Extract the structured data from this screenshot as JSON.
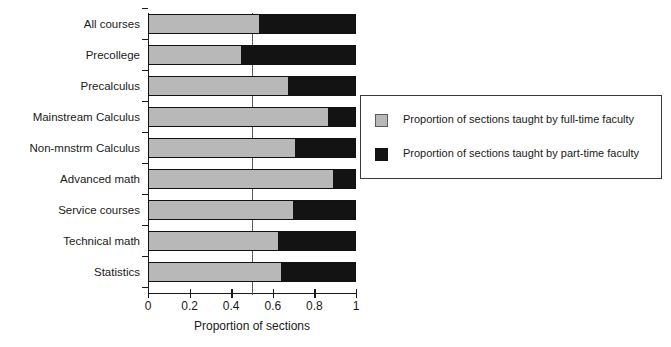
{
  "chart_data": {
    "type": "bar",
    "orientation": "horizontal",
    "stacked": true,
    "normalized": true,
    "title": "",
    "xlabel": "Proportion of sections",
    "ylabel": "",
    "xlim": [
      0,
      1
    ],
    "xticks": [
      0,
      0.2,
      0.4,
      0.6,
      0.8,
      1
    ],
    "xticklabels": [
      "0",
      "0.2",
      "0.4",
      "0.6",
      "0.8",
      "1"
    ],
    "grid": false,
    "reference_line": {
      "value": 0.5,
      "orientation": "vertical",
      "color": "#555f66"
    },
    "legend_position": "right",
    "categories": [
      "All courses",
      "Precollege",
      "Precalculus",
      "Mainstream Calculus",
      "Non-mnstrm Calculus",
      "Advanced math",
      "Service courses",
      "Technical math",
      "Statistics"
    ],
    "series": [
      {
        "name": "Proportion of sections taught by full-time faculty",
        "color": "#b8b8b8",
        "values": [
          0.53,
          0.44,
          0.67,
          0.86,
          0.7,
          0.885,
          0.69,
          0.62,
          0.635
        ]
      },
      {
        "name": "Proportion of sections taught by part-time faculty",
        "color": "#131313",
        "values": [
          0.47,
          0.56,
          0.33,
          0.14,
          0.3,
          0.115,
          0.31,
          0.38,
          0.365
        ]
      }
    ]
  },
  "legend": {
    "entries": [
      {
        "label": "Proportion of sections taught by full-time faculty",
        "swatch": "#b8b8b8"
      },
      {
        "label": "Proportion of sections taught by part-time faculty",
        "swatch": "#131313"
      }
    ]
  },
  "axis": {
    "x_title": "Proportion of sections"
  }
}
